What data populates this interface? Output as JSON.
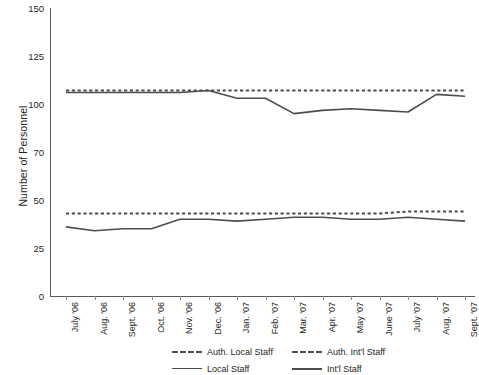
{
  "chart_data": {
    "type": "line",
    "title": "",
    "xlabel": "",
    "ylabel": "Number of Personnel",
    "categories": [
      "July '06",
      "Aug. '06",
      "Sept. '06",
      "Oct. '06",
      "Nov. '06",
      "Dec. '06",
      "Jan. '07",
      "Feb. '07",
      "Mar. '07",
      "Apr. '07",
      "May '07",
      "June '07",
      "July '07",
      "Aug. '07",
      "Sept. '07"
    ],
    "yticks": [
      0,
      25,
      50,
      70,
      100,
      125,
      150
    ],
    "ylim": [
      0,
      150
    ],
    "grid": false,
    "legend_position": "bottom",
    "series": [
      {
        "name": "Auth. Local Staff",
        "style": "dashed",
        "width": 2,
        "color": "#4d4d4d",
        "values": [
          107,
          107,
          107,
          107,
          107,
          107,
          107,
          107,
          107,
          107,
          107,
          107,
          107,
          107,
          107
        ]
      },
      {
        "name": "Auth. Int'l Staff",
        "style": "dashed",
        "width": 2,
        "color": "#4d4d4d",
        "values": [
          43,
          43,
          43,
          43,
          43,
          43,
          43,
          43,
          43,
          43,
          43,
          43,
          44,
          44,
          44
        ]
      },
      {
        "name": "Local Staff",
        "style": "solid",
        "width": 1.6,
        "color": "#4d4d4d",
        "values": [
          106,
          106,
          106,
          106,
          106,
          107,
          103,
          103,
          94,
          96,
          97,
          96,
          95,
          105,
          104
        ]
      },
      {
        "name": "Int'l Staff",
        "style": "solid",
        "width": 1.6,
        "color": "#4d4d4d",
        "values": [
          36,
          34,
          35,
          35,
          40,
          40,
          39,
          40,
          41,
          41,
          40,
          40,
          41,
          40,
          39
        ]
      }
    ]
  },
  "axis": {
    "y_title": "Number of Personnel",
    "y_labels": [
      "150",
      "125",
      "100",
      "70",
      "50",
      "25",
      "0"
    ],
    "x_labels": [
      "July '06",
      "Aug. '06",
      "Sept. '06",
      "Oct. '06",
      "Nov. '06",
      "Dec. '06",
      "Jan. '07",
      "Feb. '07",
      "Mar. '07",
      "Apr. '07",
      "May '07",
      "June '07",
      "July '07",
      "Aug. '07",
      "Sept. '07"
    ]
  },
  "legend": {
    "items": [
      {
        "label": "Auth. Local Staff",
        "style": "dashed"
      },
      {
        "label": "Auth. Int'l  Staff",
        "style": "dashed"
      },
      {
        "label": "Local Staff",
        "style": "solid-thin"
      },
      {
        "label": "Int'l Staff",
        "style": "solid-thick"
      }
    ]
  }
}
